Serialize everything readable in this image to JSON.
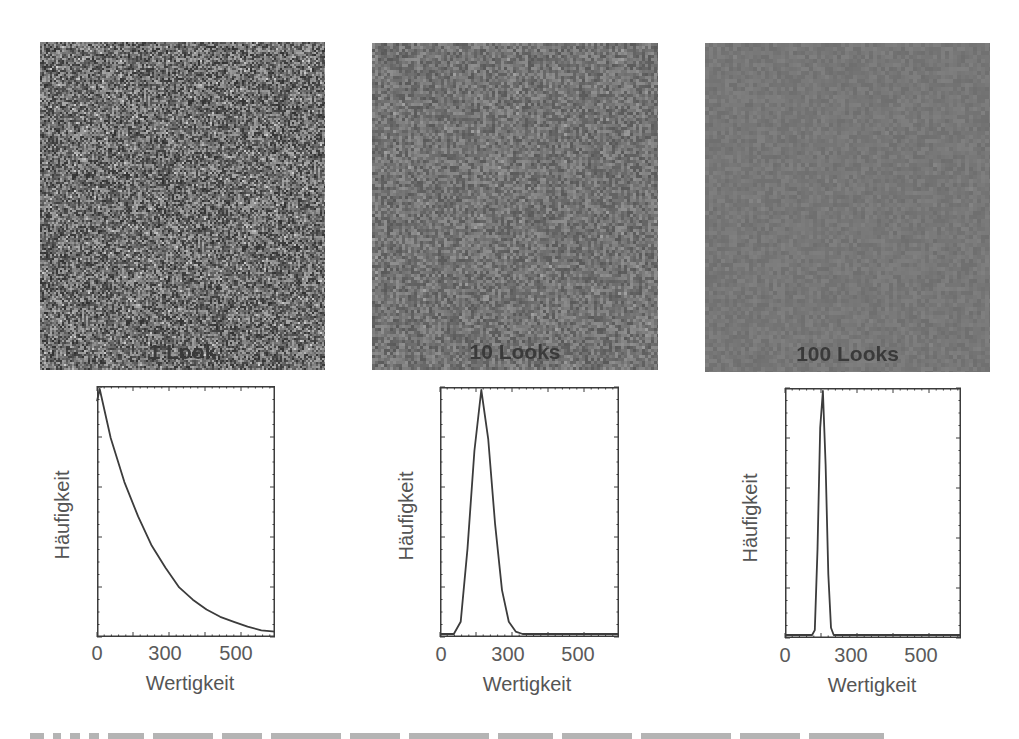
{
  "panels": [
    {
      "id": "look1",
      "image": {
        "label": "1 Look",
        "x": 40,
        "y": 42,
        "w": 285,
        "h": 328,
        "base_gray": "#6d6d6d",
        "noise": 0.55,
        "grain": 2
      },
      "plot": {
        "frame": {
          "x": 97,
          "y": 386,
          "w": 178,
          "h": 251
        },
        "ylabel": "Häufigkeit",
        "ylabel_cx": 62,
        "ylabel_cy": 515,
        "xlabel": "Wertigkeit",
        "xlabel_cx": 190,
        "xlabel_top": 672,
        "xticks": [
          {
            "label": "0",
            "cx": 97
          },
          {
            "label": "300",
            "cx": 165
          },
          {
            "label": "500",
            "cx": 236
          }
        ],
        "xtick_top": 642
      }
    },
    {
      "id": "look10",
      "image": {
        "label": "10 Looks",
        "x": 372,
        "y": 43,
        "w": 286,
        "h": 327,
        "base_gray": "#747474",
        "noise": 0.25,
        "grain": 3
      },
      "plot": {
        "frame": {
          "x": 440,
          "y": 387,
          "w": 179,
          "h": 250
        },
        "ylabel": "Häufigkeit",
        "ylabel_cx": 406,
        "ylabel_cy": 516,
        "xlabel": "Wertigkeit",
        "xlabel_cx": 527,
        "xlabel_top": 673,
        "xticks": [
          {
            "label": "0",
            "cx": 441
          },
          {
            "label": "300",
            "cx": 508
          },
          {
            "label": "500",
            "cx": 578
          }
        ],
        "xtick_top": 643
      }
    },
    {
      "id": "look100",
      "image": {
        "label": "100 Looks",
        "x": 705,
        "y": 43,
        "w": 285,
        "h": 329,
        "base_gray": "#777777",
        "noise": 0.08,
        "grain": 4
      },
      "plot": {
        "frame": {
          "x": 785,
          "y": 388,
          "w": 176,
          "h": 250
        },
        "ylabel": "Häufigkeit",
        "ylabel_cx": 750,
        "ylabel_cy": 518,
        "xlabel": "Wertigkeit",
        "xlabel_cx": 872,
        "xlabel_top": 674,
        "xticks": [
          {
            "label": "0",
            "cx": 785
          },
          {
            "label": "300",
            "cx": 851
          },
          {
            "label": "500",
            "cx": 921
          }
        ],
        "xtick_top": 644
      }
    }
  ],
  "chart_data": [
    {
      "type": "line",
      "title": "1 Look",
      "xlabel": "Wertigkeit",
      "ylabel": "Häufigkeit",
      "xticks": [
        "0",
        "300",
        "500"
      ],
      "xlim": [
        0,
        650
      ],
      "grid": false,
      "series": [
        {
          "name": "Histogramm 1 Look (exponential)",
          "x": [
            0,
            10,
            50,
            100,
            150,
            200,
            250,
            300,
            350,
            400,
            450,
            500,
            550,
            600,
            650
          ],
          "y": [
            0.95,
            1.0,
            0.8,
            0.62,
            0.48,
            0.36,
            0.27,
            0.19,
            0.14,
            0.1,
            0.07,
            0.05,
            0.03,
            0.015,
            0.01
          ]
        }
      ]
    },
    {
      "type": "line",
      "title": "10 Looks",
      "xlabel": "Wertigkeit",
      "ylabel": "Häufigkeit",
      "xticks": [
        "0",
        "300",
        "500"
      ],
      "xlim": [
        0,
        650
      ],
      "grid": false,
      "series": [
        {
          "name": "Histogramm 10 Looks",
          "x": [
            0,
            50,
            75,
            100,
            125,
            150,
            175,
            200,
            225,
            250,
            275,
            300,
            650
          ],
          "y": [
            0,
            0,
            0.05,
            0.35,
            0.75,
            1.0,
            0.8,
            0.45,
            0.18,
            0.05,
            0.01,
            0,
            0
          ]
        }
      ]
    },
    {
      "type": "line",
      "title": "100 Looks",
      "xlabel": "Wertigkeit",
      "ylabel": "Häufigkeit",
      "xticks": [
        "0",
        "300",
        "500"
      ],
      "xlim": [
        0,
        650
      ],
      "grid": false,
      "series": [
        {
          "name": "Histogramm 100 Looks",
          "x": [
            0,
            100,
            110,
            120,
            130,
            140,
            150,
            160,
            170,
            180,
            650
          ],
          "y": [
            0,
            0,
            0.02,
            0.35,
            0.85,
            1.0,
            0.7,
            0.25,
            0.03,
            0,
            0
          ]
        }
      ]
    }
  ],
  "style": {
    "line_color": "#3c3c3c",
    "frame_color": "#3c3c3c",
    "label_color": "#555555",
    "image_label_color": "#3a3a3a"
  }
}
